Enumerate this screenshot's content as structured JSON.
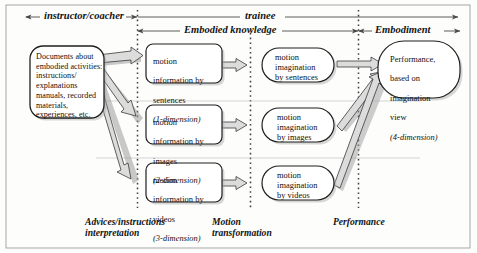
{
  "diagram": {
    "title_bar": {
      "phase_left": "instructor/coacher",
      "phase_right": "trainee",
      "band_mid": "Embodied knowledge",
      "band_right": "Embodiment"
    },
    "nodes": {
      "documents": {
        "text": "Documents about\nembodied activities:\ninstructions/\nexplanations\nmanuals, recorded\nmaterials,\nexperiences, etc."
      },
      "info_sentences": {
        "line1": "motion",
        "line2": "information by",
        "line3": "sentences",
        "dim": "(1-dimension)"
      },
      "info_images": {
        "line1": "motion",
        "line2": "information by",
        "line3": "images",
        "dim": "(2-dimension)"
      },
      "info_videos": {
        "line1": "motion",
        "line2": "information by",
        "line3": "videos",
        "dim": "(3-dimension)"
      },
      "imag_sentences": {
        "text": "motion\nimagination\nby sentences"
      },
      "imag_images": {
        "text": "motion\nimagination\nby images"
      },
      "imag_videos": {
        "text": "motion\nimagination\nby videos"
      },
      "performance": {
        "line1": "Performance,",
        "line2": "based on",
        "line3": "imagination",
        "line4": "view",
        "dim": "(4-dimension)"
      }
    },
    "stage_labels": {
      "interpretation": "Advices/instructions\ninterpretation",
      "transformation": "Motion\ntransformation",
      "performance": "Performance"
    },
    "colors": {
      "line": "#4a4a4a",
      "arrow_fill": "#d9d9d9",
      "node_stroke": "#2b2b2b",
      "shadow": "#9a9a9a",
      "divider": "#b9b9b9",
      "background": "#fdfdfc"
    }
  }
}
